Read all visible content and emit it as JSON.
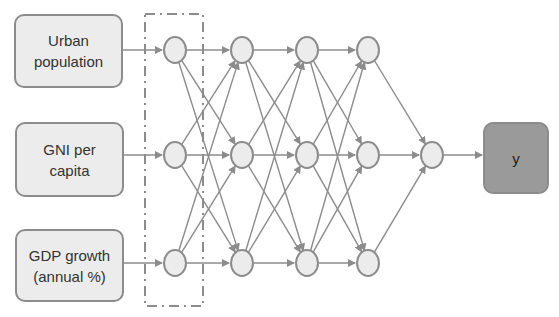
{
  "inputs": [
    {
      "label": "Urban\npopulation"
    },
    {
      "label": "GNI per\ncapita"
    },
    {
      "label": "GDP growth\n(annual %)"
    }
  ],
  "output": {
    "label": "y"
  },
  "network": {
    "layers": [
      3,
      3,
      3,
      3,
      1
    ],
    "dashed_box_around_layer": 1,
    "colors": {
      "node_fill": "#ececec",
      "stroke": "#8c8c8c",
      "output_fill": "#9a9a9a"
    }
  }
}
